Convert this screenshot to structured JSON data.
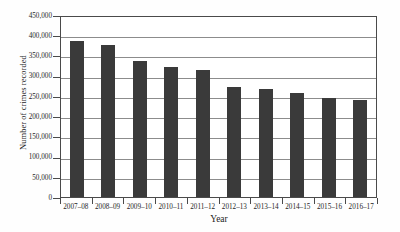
{
  "chart_data": {
    "type": "bar",
    "title": "",
    "xlabel": "Year",
    "ylabel": "Number of crimes recorded",
    "categories": [
      "2007–08",
      "2008–09",
      "2009–10",
      "2010–11",
      "2011–12",
      "2012–13",
      "2013–14",
      "2014–15",
      "2015–16",
      "2016–17"
    ],
    "values": [
      385000,
      377000,
      337000,
      322000,
      313000,
      272000,
      267000,
      256000,
      245000,
      240000
    ],
    "ylim": [
      0,
      450000
    ],
    "ytick_values": [
      0,
      50000,
      100000,
      150000,
      200000,
      250000,
      300000,
      350000,
      400000,
      450000
    ],
    "ytick_labels": [
      "0",
      "50,000",
      "100,000",
      "150,000",
      "200,000",
      "250,000",
      "300,000",
      "350,000",
      "400,000",
      "450,000"
    ],
    "grid": true,
    "legend": "none",
    "bar_color": "#3a3a3a",
    "axis_color": "#4a4a4a",
    "grid_color": "#8c8c8c",
    "background_color": "#ffffff"
  }
}
